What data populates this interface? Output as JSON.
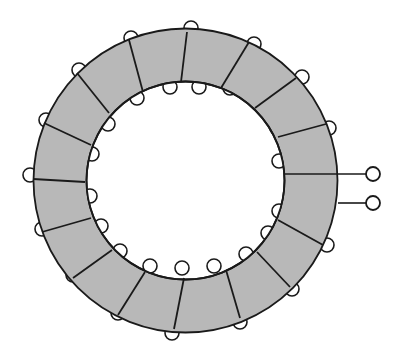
{
  "diagram": {
    "colors": {
      "background": "#ffffff",
      "core_fill": "#b8b8b8",
      "stroke": "#1a1a1a"
    },
    "core": {
      "cx": 185.5,
      "cy": 180.5,
      "outer_radius": 152,
      "inner_radius": 99
    },
    "turns": [
      {
        "outer": [
          326,
          124
        ],
        "inner": [
          278,
          137
        ]
      },
      {
        "outer": [
          296,
          78
        ],
        "inner": [
          255,
          108
        ]
      },
      {
        "outer": [
          249,
          42
        ],
        "inner": [
          221,
          88
        ]
      },
      {
        "outer": [
          187,
          32
        ],
        "inner": [
          181,
          82
        ]
      },
      {
        "outer": [
          129,
          40
        ],
        "inner": [
          143,
          92
        ]
      },
      {
        "outer": [
          77,
          73
        ],
        "inner": [
          109,
          113
        ]
      },
      {
        "outer": [
          44,
          123
        ],
        "inner": [
          91,
          145
        ]
      },
      {
        "outer": [
          33,
          179
        ],
        "inner": [
          85,
          182
        ]
      },
      {
        "outer": [
          42,
          232
        ],
        "inner": [
          91,
          218
        ]
      },
      {
        "outer": [
          73,
          278
        ],
        "inner": [
          112,
          250
        ]
      },
      {
        "outer": [
          118,
          315
        ],
        "inner": [
          145,
          272
        ]
      },
      {
        "outer": [
          174,
          329
        ],
        "inner": [
          184,
          278
        ]
      },
      {
        "outer": [
          240,
          318
        ],
        "inner": [
          226,
          270
        ]
      },
      {
        "outer": [
          290,
          287
        ],
        "inner": [
          257,
          252
        ]
      },
      {
        "outer": [
          323,
          245
        ],
        "inner": [
          278,
          220
        ]
      }
    ],
    "inner_loops": [
      [
        279,
        161
      ],
      [
        277,
        128
      ],
      [
        262,
        103
      ],
      [
        230,
        88
      ],
      [
        199,
        87
      ],
      [
        170,
        87
      ],
      [
        137,
        98
      ],
      [
        108,
        124
      ],
      [
        92,
        154
      ],
      [
        90,
        196
      ],
      [
        101,
        226
      ],
      [
        120,
        251
      ],
      [
        150,
        266
      ],
      [
        182,
        268
      ],
      [
        214,
        266
      ],
      [
        246,
        254
      ],
      [
        268,
        233
      ],
      [
        279,
        211
      ]
    ],
    "outer_loops": [
      [
        329,
        128
      ],
      [
        302,
        77
      ],
      [
        254,
        44
      ],
      [
        191,
        28
      ],
      [
        131,
        38
      ],
      [
        79,
        70
      ],
      [
        46,
        120
      ],
      [
        30,
        175
      ],
      [
        42,
        229
      ],
      [
        73,
        275
      ],
      [
        118,
        313
      ],
      [
        172,
        333
      ],
      [
        240,
        322
      ],
      [
        292,
        289
      ],
      [
        327,
        245
      ]
    ],
    "terminals": [
      {
        "label": "terminal-1",
        "lead_from": [
          285,
          174
        ],
        "lead_to": [
          366,
          174
        ],
        "circle": [
          373,
          174
        ],
        "r": 7
      },
      {
        "label": "terminal-2",
        "lead_from": [
          338,
          203
        ],
        "lead_to": [
          366,
          203
        ],
        "circle": [
          373,
          203
        ],
        "r": 7
      }
    ]
  }
}
